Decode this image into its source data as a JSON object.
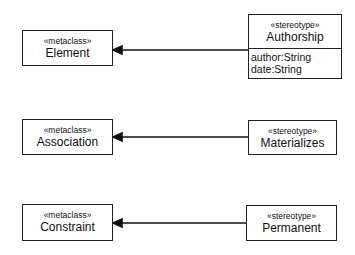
{
  "diagram": {
    "type": "UML profile diagram",
    "rows": [
      {
        "metaclass": {
          "stereotype": "«metaclass»",
          "name": "Element"
        },
        "stereotype": {
          "stereotype": "«stereotype»",
          "name": "Authorship",
          "attributes": [
            "author:String",
            "date:String"
          ]
        }
      },
      {
        "metaclass": {
          "stereotype": "«metaclass»",
          "name": "Association"
        },
        "stereotype": {
          "stereotype": "«stereotype»",
          "name": "Materializes"
        }
      },
      {
        "metaclass": {
          "stereotype": "«metaclass»",
          "name": "Constraint"
        },
        "stereotype": {
          "stereotype": "«stereotype»",
          "name": "Permanent"
        }
      }
    ],
    "relation": "extension (filled arrowhead pointing to metaclass)"
  }
}
